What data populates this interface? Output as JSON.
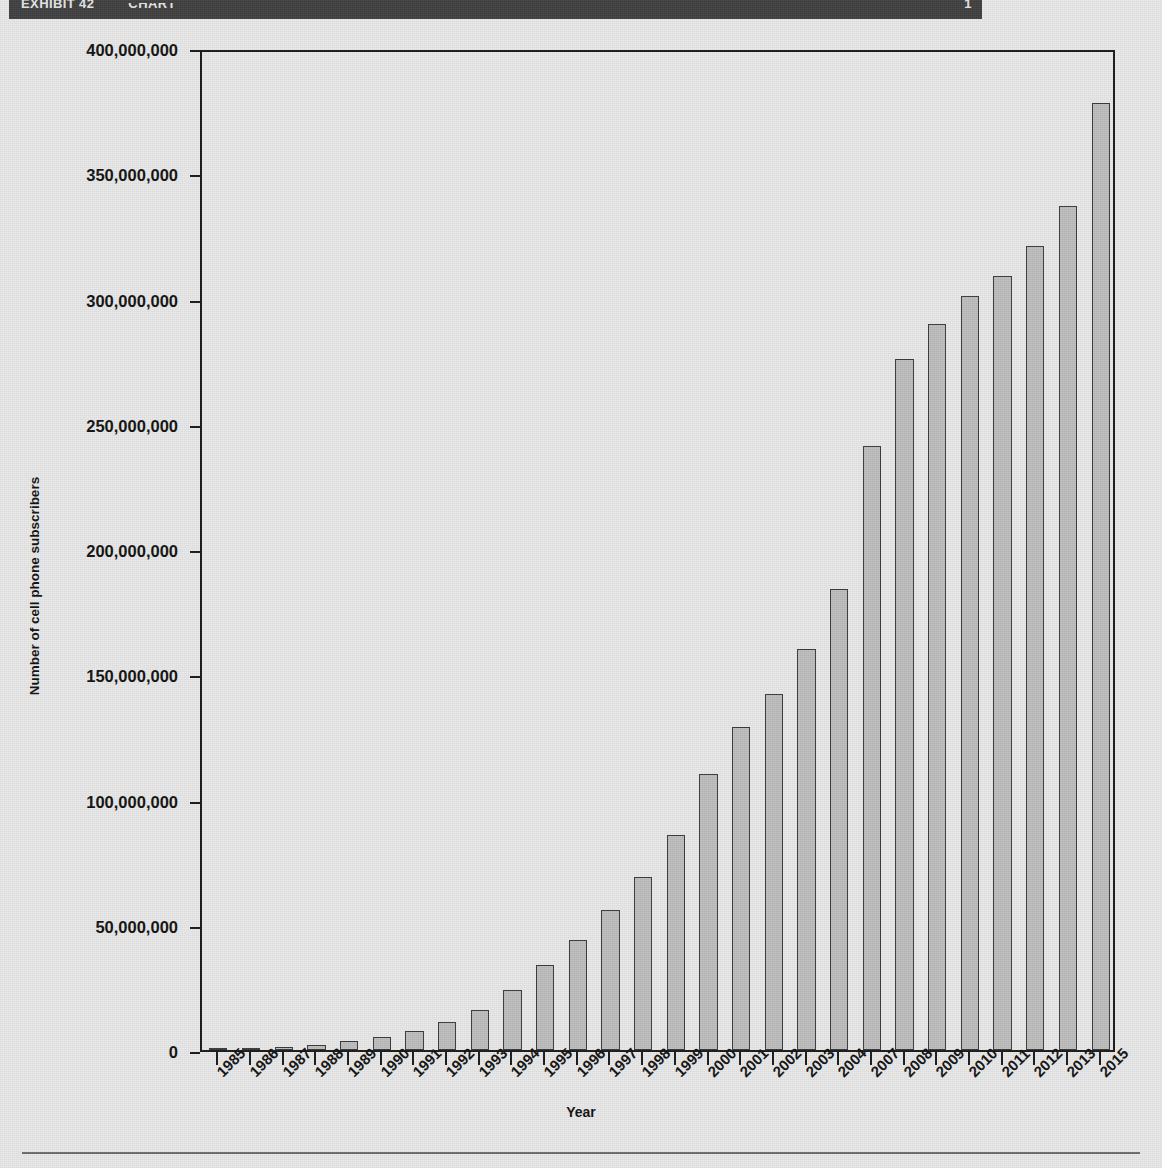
{
  "banner": {
    "left_text": "EXHIBIT 42",
    "middle_text": "CHART",
    "right_text": "1",
    "background": "#3f3f3f",
    "text_color": "#e6e6e6"
  },
  "chart_data": {
    "type": "bar",
    "title": "",
    "xlabel": "Year",
    "ylabel": "Number of cell phone subscribers",
    "ylim": [
      0,
      400000000
    ],
    "yticks": [
      0,
      50000000,
      100000000,
      150000000,
      200000000,
      250000000,
      300000000,
      350000000,
      400000000
    ],
    "ytick_labels": [
      "0",
      "50,000,000",
      "100,000,000",
      "150,000,000",
      "200,000,000",
      "250,000,000",
      "300,000,000",
      "350,000,000",
      "400,000,000"
    ],
    "grid": false,
    "legend": null,
    "bar_fill": "#bdbdbd",
    "bar_stroke": "#3a3a3a",
    "categories": [
      "1985",
      "1986",
      "1987",
      "1988",
      "1989",
      "1990",
      "1991",
      "1992",
      "1993",
      "1994",
      "1995",
      "1996",
      "1997",
      "1998",
      "1999",
      "2000",
      "2001",
      "2002",
      "2003",
      "2004",
      "2007",
      "2008",
      "2009",
      "2010",
      "2011",
      "2012",
      "2013",
      "2015"
    ],
    "values": [
      340000,
      682000,
      1231000,
      2069000,
      3509000,
      5283000,
      7557000,
      11033000,
      16009000,
      24134000,
      33786000,
      44043000,
      55312000,
      69209000,
      86047000,
      109478000,
      128375000,
      140767000,
      158722000,
      182140000,
      238800000,
      270334000,
      285646000,
      296286000,
      305000000,
      316000000,
      332000000,
      377900000
    ],
    "bar_top_estimates": [
      339000,
      682000,
      1231000,
      2069000,
      3509000,
      5283000,
      7557000,
      11000000,
      16000000,
      24000000,
      34000000,
      44000000,
      56000000,
      69000000,
      86000000,
      110000000,
      129000000,
      142000000,
      160000000,
      184000000,
      241000000,
      276000000,
      290000000,
      301000000,
      309000000,
      321000000,
      337000000,
      378000000
    ]
  }
}
